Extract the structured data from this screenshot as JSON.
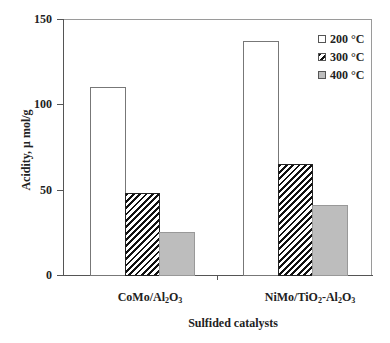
{
  "chart_data": {
    "type": "bar",
    "title": "",
    "xlabel": "Sulfided catalysts",
    "ylabel": "Acidity, μ mol/g",
    "ylim": [
      0,
      150
    ],
    "yticks": [
      0,
      50,
      100,
      150
    ],
    "grid": false,
    "legend_position": "top-right inside",
    "categories": [
      "CoMo/Al2O3",
      "NiMo/TiO2-Al2O3"
    ],
    "series": [
      {
        "name": "200 °C",
        "pattern": "white",
        "values": [
          110,
          137
        ]
      },
      {
        "name": "300 °C",
        "pattern": "diagonal-hatch",
        "values": [
          48,
          65
        ]
      },
      {
        "name": "400 °C",
        "pattern": "gray",
        "values": [
          25,
          41
        ]
      }
    ]
  },
  "axes": {
    "xlabel": "Sulfided catalysts",
    "ylabel": "Acidity, μ mol/g",
    "yticks": [
      "0",
      "50",
      "100",
      "150"
    ]
  },
  "categories": {
    "cat1": {
      "main": "CoMo/Al",
      "sub1": "2",
      "mid": "O",
      "sub2": "3"
    },
    "cat2": {
      "p1": "NiMo/TiO",
      "s1": "2",
      "p2": "-Al",
      "s2": "2",
      "p3": "O",
      "s3": "3"
    }
  },
  "legend": [
    "200 °C",
    "300 °C",
    "400 °C"
  ],
  "colors": {
    "s200": "#ffffff",
    "s300": "#111111",
    "s400": "#bdbdbd"
  }
}
